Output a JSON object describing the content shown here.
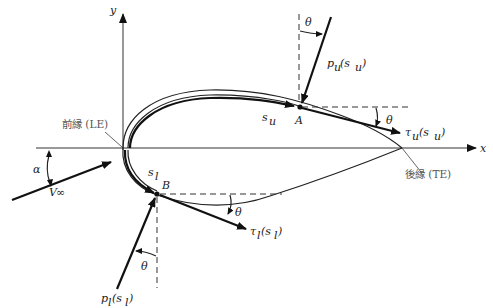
{
  "figure": {
    "type": "airfoil pressure and shear stress diagram",
    "axes": {
      "x_label": "x",
      "y_label": "y"
    },
    "labels": {
      "leading_edge": "前縁 (LE)",
      "trailing_edge": "後縁 (TE)",
      "point_upper": "A",
      "point_lower": "B",
      "s_upper": "s",
      "s_upper_sub": "u",
      "s_lower": "s",
      "s_lower_sub": "l",
      "pressure_upper": "p",
      "pressure_upper_sub": "u",
      "pressure_upper_arg": "(s",
      "pressure_upper_arg_sub": "u",
      "pressure_upper_close": ")",
      "shear_upper": "τ",
      "shear_upper_sub": "u",
      "shear_upper_arg": "(s",
      "shear_upper_arg_sub": "u",
      "shear_upper_close": ")",
      "pressure_lower": "p",
      "pressure_lower_sub": "l",
      "pressure_lower_arg": "(s",
      "pressure_lower_arg_sub": "l",
      "pressure_lower_close": ")",
      "shear_lower": "τ",
      "shear_lower_sub": "l",
      "shear_lower_arg": "(s",
      "shear_lower_arg_sub": "l",
      "shear_lower_close": ")",
      "theta": "θ",
      "alpha": "α",
      "freestream": "V",
      "freestream_sub": "∞"
    },
    "colors": {
      "line": "#111111",
      "label_gray": "#555555",
      "background": "#ffffff"
    }
  }
}
